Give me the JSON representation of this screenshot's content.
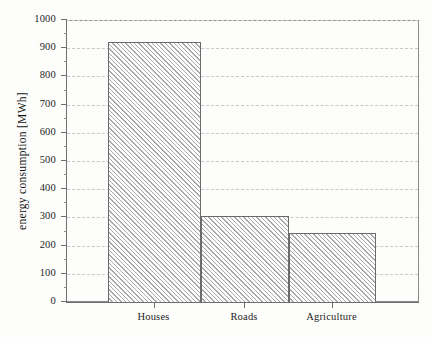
{
  "chart_data": {
    "type": "bar",
    "title": "",
    "subtitle": "",
    "xlabel": "",
    "ylabel": "energy  consumption  [MWh]",
    "categories": [
      "Houses",
      "Roads",
      "Agriculture"
    ],
    "values": [
      925,
      310,
      250
    ],
    "series": [
      {
        "name": "energy consumption",
        "values": [
          925,
          310,
          250
        ]
      }
    ],
    "ylim": [
      0,
      1000
    ],
    "xlim": [
      0,
      3
    ],
    "y_major_ticks": [
      0,
      100,
      200,
      300,
      400,
      500,
      600,
      700,
      800,
      900,
      1000
    ],
    "y_tick_labels": [
      "0",
      "100",
      "200",
      "300",
      "400",
      "500",
      "600",
      "700",
      "800",
      "900",
      "1000"
    ],
    "y_minor_tick_interval": 50,
    "grid": true,
    "grid_axis": "y",
    "grid_style": "dashed",
    "legend": false,
    "legend_position": "none",
    "bar_fill": "diagonal-hatch",
    "bar_edge_color": "#6b6b6b",
    "grid_color": "#c9c9c9",
    "axis_color": "#6f6f6f",
    "text_color": "#1d1d1d",
    "background_color": "#fdfdfc",
    "annotations": []
  },
  "axes": {
    "y_title": "energy  consumption  [MWh]"
  }
}
